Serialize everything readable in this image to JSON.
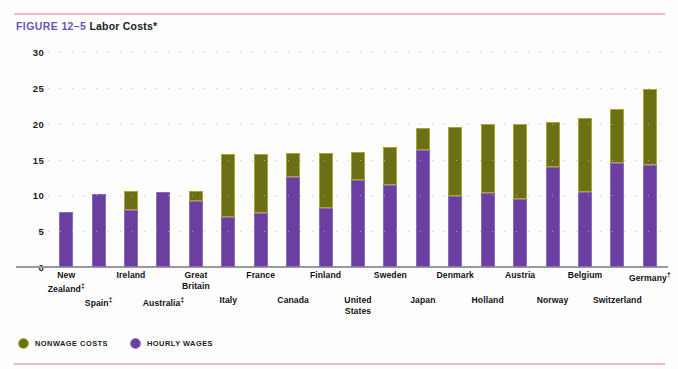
{
  "figure": {
    "number": "FIGURE 12–5",
    "title": "Labor Costs*"
  },
  "legend": {
    "items": [
      {
        "label": "NONWAGE COSTS",
        "color": "#6b7016",
        "key": "nonwage"
      },
      {
        "label": "HOURLY WAGES",
        "color": "#6b3fa0",
        "key": "wages"
      }
    ]
  },
  "chart_data": {
    "type": "bar",
    "stacked": true,
    "title": "Labor Costs*",
    "xlabel": "",
    "ylabel": "",
    "ylim": [
      0,
      30
    ],
    "yticks": [
      "0",
      "5",
      "10",
      "15",
      "20",
      "25",
      "30"
    ],
    "grid": true,
    "legend_position": "bottom-left",
    "categories": [
      "New Zealand‡",
      "Spain‡",
      "Ireland",
      "Australia‡",
      "Great Britain",
      "Italy",
      "France",
      "Canada",
      "Finland",
      "United States",
      "Sweden",
      "Japan",
      "Denmark",
      "Holland",
      "Austria",
      "Norway",
      "Belgium",
      "Switzerland",
      "Germany†"
    ],
    "series": [
      {
        "name": "HOURLY WAGES",
        "color": "#6b3fa0",
        "values": [
          7.7,
          10.2,
          8.0,
          10.5,
          9.2,
          7.0,
          7.5,
          12.6,
          8.3,
          12.2,
          11.5,
          16.3,
          9.9,
          10.3,
          9.5,
          14.0,
          10.4,
          14.5,
          14.2
        ]
      },
      {
        "name": "NONWAGE COSTS",
        "color": "#6b7016",
        "values": [
          0.0,
          0.0,
          2.6,
          0.0,
          1.4,
          8.8,
          8.3,
          3.3,
          7.6,
          3.9,
          5.3,
          3.1,
          9.6,
          9.6,
          10.4,
          6.2,
          10.4,
          7.6,
          10.6
        ]
      }
    ],
    "totals": [
      7.7,
      10.2,
      10.6,
      10.5,
      10.6,
      15.8,
      15.8,
      15.9,
      15.9,
      16.1,
      16.8,
      19.4,
      19.5,
      19.9,
      19.9,
      20.2,
      20.8,
      22.1,
      24.8
    ],
    "label_rows": [
      0,
      1,
      0,
      1,
      0,
      1,
      0,
      1,
      0,
      1,
      0,
      1,
      0,
      1,
      0,
      1,
      0,
      1,
      0
    ]
  },
  "colors": {
    "rule": "#f0b8c8",
    "figure_number": "#6a57b5",
    "wages": "#6b3fa0",
    "nonwage": "#6b7016",
    "axis": "#9a9a9a"
  }
}
